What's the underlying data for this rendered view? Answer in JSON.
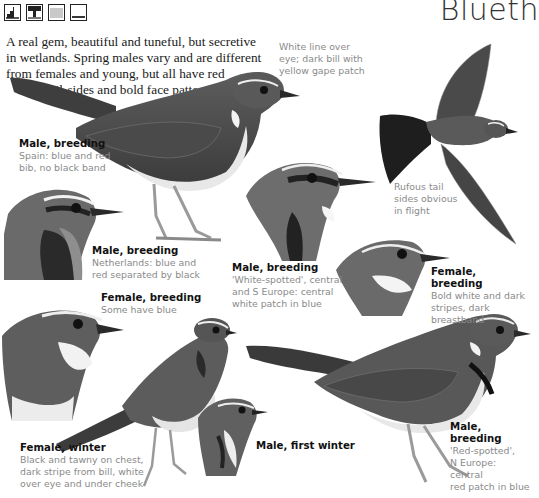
{
  "page": {
    "title": "Blueth",
    "habitat_icons": [
      {
        "name": "woodland-edge-icon"
      },
      {
        "name": "wetland-reeds-icon"
      },
      {
        "name": "lake-water-icon"
      },
      {
        "name": "open-ground-icon"
      }
    ],
    "intro": {
      "line1": "A real gem, beautiful and tuneful, but secretive",
      "line2": "in wetlands. Spring males vary and are different",
      "line3": "from females and young, but all have red",
      "line4": "tail-sides and bold face patterns"
    }
  },
  "notes": {
    "bill": {
      "line1": "White line over",
      "line2": "eye; dark bill with",
      "line3": "yellow gape patch"
    },
    "flight": {
      "line1": "Rufous tail",
      "line2": "sides obvious",
      "line3": "in flight"
    }
  },
  "captions": [
    {
      "id": "male-breeding-spain",
      "title": "Male, breeding",
      "lines": [
        "Spain: blue and red",
        "bib, no black band"
      ]
    },
    {
      "id": "male-breeding-netherlands",
      "title": "Male, breeding",
      "lines": [
        "Netherlands: blue and",
        "red separated by black"
      ]
    },
    {
      "id": "male-breeding-white-spotted",
      "title": "Male, breeding",
      "lines": [
        "'White-spotted', central",
        "and S Europe: central",
        "white patch in blue"
      ]
    },
    {
      "id": "female-breeding-bold",
      "title": "Female, breeding",
      "lines": [
        "Bold white and dark",
        "stripes, dark breastband"
      ]
    },
    {
      "id": "female-breeding-blue",
      "title": "Female, breeding",
      "lines": [
        "Some have blue"
      ]
    },
    {
      "id": "female-winter",
      "title": "Female, winter",
      "lines": [
        "Black and tawny on chest,",
        "dark stripe from bill, white",
        "over eye and under cheek"
      ]
    },
    {
      "id": "male-first-winter",
      "title": "Male, first winter",
      "lines": []
    },
    {
      "id": "male-breeding-red-spotted",
      "title": "Male, breeding",
      "lines": [
        "'Red-spotted',",
        "N Europe: central",
        "red patch in blue"
      ]
    }
  ]
}
